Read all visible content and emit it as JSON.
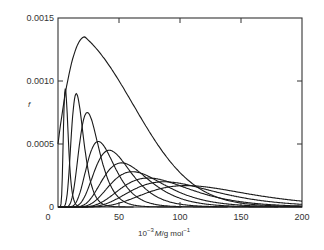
{
  "chart_data": {
    "type": "line",
    "title": "",
    "xlabel": "10^-3 M/g mol^-1",
    "xlabel_parts": {
      "base": "10",
      "exp": "−3",
      "main": "M/g mol",
      "exp2": "−1"
    },
    "ylabel": "f",
    "xlim": [
      0,
      200
    ],
    "ylim": [
      0,
      0.0015
    ],
    "grid": false,
    "legend": null,
    "x_ticks": [
      0,
      50,
      100,
      150,
      200
    ],
    "x_tick_labels": [
      "0",
      "50",
      "100",
      "150",
      "200"
    ],
    "y_ticks": [
      0,
      0.0005,
      0.001,
      0.0015
    ],
    "y_tick_labels": [
      "0",
      "0.0005",
      "0.0010",
      "0.0015"
    ],
    "series": [
      {
        "name": "envelope",
        "kind": "envelope",
        "peak_x": 22,
        "peak_y": 0.00135,
        "start_y": 0.0005,
        "end_x": 200
      },
      {
        "name": "fraction-1",
        "peak_x": 6,
        "peak_y": 0.00094
      },
      {
        "name": "fraction-2",
        "peak_x": 15,
        "peak_y": 0.0009
      },
      {
        "name": "fraction-3",
        "peak_x": 24,
        "peak_y": 0.00075
      },
      {
        "name": "fraction-4",
        "peak_x": 33,
        "peak_y": 0.00052
      },
      {
        "name": "fraction-5",
        "peak_x": 42,
        "peak_y": 0.00045
      },
      {
        "name": "fraction-6",
        "peak_x": 52,
        "peak_y": 0.00035
      },
      {
        "name": "fraction-7",
        "peak_x": 61,
        "peak_y": 0.00028
      },
      {
        "name": "fraction-8",
        "peak_x": 74,
        "peak_y": 0.00023
      },
      {
        "name": "fraction-9",
        "peak_x": 87,
        "peak_y": 0.0002
      },
      {
        "name": "fraction-10",
        "peak_x": 105,
        "peak_y": 0.00017
      }
    ]
  }
}
